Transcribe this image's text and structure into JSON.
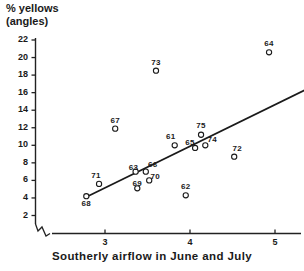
{
  "chart_data": {
    "type": "scatter",
    "title": "",
    "xlabel": "Southerly airflow in June and July",
    "ylabel": "% yellows (angles)",
    "ylabel_line1": "% yellows",
    "ylabel_line2": "(angles)",
    "xlim": [
      2.55,
      5.2
    ],
    "ylim": [
      0,
      22
    ],
    "xticks": [
      3,
      4,
      5
    ],
    "xticklabels": [
      "3",
      "4",
      "5"
    ],
    "yticks": [
      2,
      4,
      6,
      8,
      10,
      12,
      14,
      16,
      18,
      20,
      22
    ],
    "yticklabels": [
      "2",
      "4",
      "6",
      "8",
      "10",
      "12",
      "14",
      "16",
      "18",
      "20",
      "22"
    ],
    "grid": false,
    "legend": null,
    "axis_break": "x-axis broken near origin",
    "marker": "open-circle",
    "points": [
      {
        "label": "68",
        "x": 2.78,
        "y": 4.2
      },
      {
        "label": "71",
        "x": 2.93,
        "y": 5.6
      },
      {
        "label": "67",
        "x": 3.12,
        "y": 11.9
      },
      {
        "label": "63",
        "x": 3.36,
        "y": 7.0
      },
      {
        "label": "66",
        "x": 3.48,
        "y": 7.0
      },
      {
        "label": "69",
        "x": 3.38,
        "y": 5.1
      },
      {
        "label": "70",
        "x": 3.52,
        "y": 6.0
      },
      {
        "label": "73",
        "x": 3.6,
        "y": 18.5
      },
      {
        "label": "61",
        "x": 3.82,
        "y": 10.0
      },
      {
        "label": "62",
        "x": 3.95,
        "y": 4.3
      },
      {
        "label": "65",
        "x": 4.06,
        "y": 9.7
      },
      {
        "label": "74",
        "x": 4.18,
        "y": 10.0
      },
      {
        "label": "75",
        "x": 4.13,
        "y": 11.2
      },
      {
        "label": "72",
        "x": 4.52,
        "y": 8.7
      },
      {
        "label": "64",
        "x": 4.93,
        "y": 20.6
      }
    ],
    "fit_line": {
      "x1": 2.78,
      "y1": 4.1,
      "x2": 5.48,
      "y2": 16.9
    }
  },
  "axes": {
    "y_axis_name": "y-axis",
    "x_axis_name": "x-axis"
  }
}
